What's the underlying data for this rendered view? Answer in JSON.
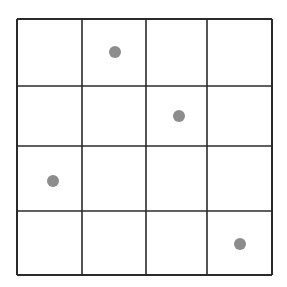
{
  "grid": {
    "rows": 4,
    "cols": 4,
    "x_lines": [
      17,
      82,
      146,
      207,
      272
    ],
    "y_lines": [
      19,
      86,
      146,
      211,
      275
    ],
    "line_color": "#2a2a2a",
    "background": "#ffffff"
  },
  "dots": [
    {
      "row": 0,
      "col": 1,
      "cx": 115,
      "cy": 52
    },
    {
      "row": 1,
      "col": 2,
      "cx": 179,
      "cy": 116
    },
    {
      "row": 2,
      "col": 0,
      "cx": 53,
      "cy": 181
    },
    {
      "row": 3,
      "col": 3,
      "cx": 240,
      "cy": 244
    }
  ],
  "dot_style": {
    "radius": 6,
    "color": "#8c8c8c"
  }
}
